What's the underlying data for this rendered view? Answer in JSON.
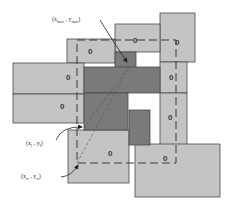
{
  "diagram": {
    "type": "overlapping-rectangles-bounding-box",
    "colors": {
      "light_fill": "#c4c4c4",
      "dark_fill": "#7a7a7a",
      "stroke": "#4a4a4a",
      "dashed": "#3a3a3a",
      "background": "#ffffff"
    },
    "object_marker": "0",
    "labels": {
      "max_point": {
        "x": "x",
        "x_sub": "max",
        "sep": ",",
        "y": "y",
        "y_sub": "max"
      },
      "left_point": {
        "x": "x",
        "x_sub": "l",
        "sep": ",",
        "y": "y",
        "y_sub": "l"
      },
      "rr_point": {
        "x": "x",
        "x_sub": "rr",
        "sep": ",",
        "y": "y",
        "y_sub": "rr"
      }
    },
    "light_rects": [
      {
        "id": "top-right-tall",
        "x": 160,
        "y": 13,
        "w": 35,
        "h": 49,
        "mark": "0",
        "mx": 175,
        "my": 45
      },
      {
        "id": "top-middle",
        "x": 115,
        "y": 24,
        "w": 45,
        "h": 28,
        "mark": "0",
        "mx": 133,
        "my": 43
      },
      {
        "id": "top-left",
        "x": 67,
        "y": 39,
        "w": 48,
        "h": 24,
        "mark": "0",
        "mx": 88,
        "my": 54
      },
      {
        "id": "left-upper",
        "x": 13,
        "y": 63,
        "w": 71,
        "h": 31,
        "mark": "0",
        "mx": 66,
        "my": 80
      },
      {
        "id": "left-lower",
        "x": 13,
        "y": 94,
        "w": 71,
        "h": 29,
        "mark": "0",
        "mx": 60,
        "my": 109
      },
      {
        "id": "right-col-upper",
        "x": 160,
        "y": 62,
        "w": 27,
        "h": 31,
        "mark": "0",
        "mx": 169,
        "my": 80
      },
      {
        "id": "right-col-lower",
        "x": 160,
        "y": 93,
        "w": 27,
        "h": 52,
        "mark": "0",
        "mx": 168,
        "my": 120
      },
      {
        "id": "bottom-left",
        "x": 68,
        "y": 130,
        "w": 61,
        "h": 53,
        "mark": "0",
        "mx": 108,
        "my": 156
      },
      {
        "id": "bottom-right",
        "x": 135,
        "y": 144,
        "w": 85,
        "h": 53,
        "mark": "0",
        "mx": 163,
        "my": 161
      }
    ],
    "dark_rects": [
      {
        "id": "dark-small-top",
        "x": 115,
        "y": 52,
        "w": 21,
        "h": 16
      },
      {
        "id": "dark-wide",
        "x": 84,
        "y": 67,
        "w": 76,
        "h": 26
      },
      {
        "id": "dark-mid-left",
        "x": 84,
        "y": 93,
        "w": 44,
        "h": 37
      },
      {
        "id": "dark-small-right",
        "x": 129,
        "y": 110,
        "w": 21,
        "h": 35
      }
    ],
    "bounding_box": {
      "x1": 77,
      "y1": 40,
      "x2": 176,
      "y2": 163
    }
  }
}
